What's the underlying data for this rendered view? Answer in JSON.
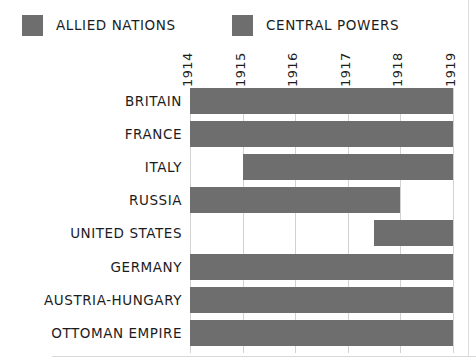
{
  "legend": {
    "entries": [
      {
        "label": "ALLIED NATIONS",
        "color": "#6e6e6e",
        "swatch_icon": "color-swatch-icon"
      },
      {
        "label": "CENTRAL POWERS",
        "color": "#6e6e6e",
        "swatch_icon": "color-swatch-icon"
      }
    ]
  },
  "chart_data": {
    "type": "bar",
    "orientation": "horizontal",
    "subtype": "gantt-timeline",
    "title": "",
    "subtitle": "",
    "xlabel": "",
    "ylabel": "",
    "xlim": [
      1914,
      1919
    ],
    "grid": true,
    "legend_position": "top",
    "xticks": [
      "1914",
      "1915",
      "1916",
      "1917",
      "1918",
      "1919"
    ],
    "xtick_values": [
      1914,
      1915,
      1916,
      1917,
      1918,
      1919
    ],
    "categories": [
      "BRITAIN",
      "FRANCE",
      "ITALY",
      "RUSSIA",
      "UNITED STATES",
      "GERMANY",
      "AUSTRIA-HUNGARY",
      "OTTOMAN EMPIRE"
    ],
    "series": [
      {
        "name": "ALLIED NATIONS",
        "color": "#6e6e6e",
        "bars": [
          {
            "category": "BRITAIN",
            "start": 1914,
            "end": 1919
          },
          {
            "category": "FRANCE",
            "start": 1914,
            "end": 1919
          },
          {
            "category": "ITALY",
            "start": 1915,
            "end": 1919
          },
          {
            "category": "RUSSIA",
            "start": 1914,
            "end": 1918
          },
          {
            "category": "UNITED STATES",
            "start": 1917.5,
            "end": 1919
          }
        ]
      },
      {
        "name": "CENTRAL POWERS",
        "color": "#6e6e6e",
        "bars": [
          {
            "category": "GERMANY",
            "start": 1914,
            "end": 1919
          },
          {
            "category": "AUSTRIA-HUNGARY",
            "start": 1914,
            "end": 1919
          },
          {
            "category": "OTTOMAN EMPIRE",
            "start": 1914,
            "end": 1919
          }
        ]
      }
    ],
    "rows": [
      {
        "label": "BRITAIN",
        "group": "ALLIED NATIONS",
        "start": 1914,
        "end": 1919
      },
      {
        "label": "FRANCE",
        "group": "ALLIED NATIONS",
        "start": 1914,
        "end": 1919
      },
      {
        "label": "ITALY",
        "group": "ALLIED NATIONS",
        "start": 1915,
        "end": 1919
      },
      {
        "label": "RUSSIA",
        "group": "ALLIED NATIONS",
        "start": 1914,
        "end": 1918
      },
      {
        "label": "UNITED STATES",
        "group": "ALLIED NATIONS",
        "start": 1917.5,
        "end": 1919
      },
      {
        "label": "GERMANY",
        "group": "CENTRAL POWERS",
        "start": 1914,
        "end": 1919
      },
      {
        "label": "AUSTRIA-HUNGARY",
        "group": "CENTRAL POWERS",
        "start": 1914,
        "end": 1919
      },
      {
        "label": "OTTOMAN EMPIRE",
        "group": "CENTRAL POWERS",
        "start": 1914,
        "end": 1919
      }
    ]
  },
  "style": {
    "bar_color": "#6e6e6e",
    "gridline_color": "#d2d2d2",
    "text_color": "#1c1c1c",
    "background": "#ffffff",
    "rule_color": "#d8d8d8"
  }
}
